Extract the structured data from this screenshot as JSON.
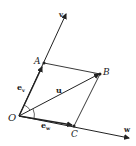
{
  "diagram": {
    "title": "",
    "points": {
      "origin": "O",
      "a": "A",
      "b": "B",
      "c": "C"
    },
    "axes": {
      "v": "v",
      "w": "w"
    },
    "vectors": {
      "u": "u",
      "e_v_base": "e",
      "e_v_sub": "v",
      "e_w_base": "e",
      "e_w_sub": "w"
    },
    "colors": {
      "ink": "#222222",
      "background": "#ffffff"
    }
  }
}
